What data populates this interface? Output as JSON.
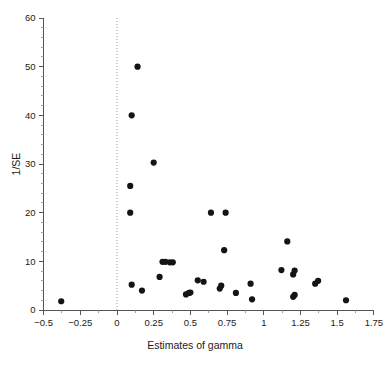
{
  "figure": {
    "background": "#ffffff",
    "point_color": "#141414",
    "axis_color": "#555555",
    "reference_line_color": "#9a9a9a"
  },
  "chart_data": {
    "type": "scatter",
    "title": "",
    "xlabel": "Estimates of gamma",
    "ylabel": "1/SE",
    "xlim": [
      -0.5,
      1.75
    ],
    "ylim": [
      0,
      60
    ],
    "xticks": [
      -0.5,
      -0.25,
      0,
      0.25,
      0.5,
      0.75,
      1,
      1.25,
      1.5,
      1.75
    ],
    "xtick_labels": [
      "−0.5",
      "−0.25",
      "0",
      "0.25",
      "0.5",
      "0.75",
      "1",
      "1.25",
      "1.5",
      "1.75"
    ],
    "yticks": [
      0,
      10,
      20,
      30,
      40,
      50,
      60
    ],
    "ytick_labels": [
      "0",
      "10",
      "20",
      "30",
      "40",
      "50",
      "60"
    ],
    "x_minor_tick_step": 0.125,
    "y_minor_tick_step": 2,
    "grid": false,
    "legend": null,
    "annotations": [
      {
        "type": "vline",
        "x": 0,
        "style": "dotted",
        "label": "null effect reference line"
      }
    ],
    "marker": {
      "shape": "circle",
      "size_px": 6.2,
      "filled": true
    },
    "points": [
      {
        "x": -0.38,
        "y": 1.8
      },
      {
        "x": 0.09,
        "y": 20.0
      },
      {
        "x": 0.09,
        "y": 25.5
      },
      {
        "x": 0.1,
        "y": 40.0
      },
      {
        "x": 0.1,
        "y": 5.2
      },
      {
        "x": 0.14,
        "y": 50.0
      },
      {
        "x": 0.17,
        "y": 4.0
      },
      {
        "x": 0.25,
        "y": 30.3
      },
      {
        "x": 0.29,
        "y": 6.8
      },
      {
        "x": 0.31,
        "y": 9.9
      },
      {
        "x": 0.33,
        "y": 9.9
      },
      {
        "x": 0.36,
        "y": 9.8
      },
      {
        "x": 0.38,
        "y": 9.8
      },
      {
        "x": 0.47,
        "y": 3.2
      },
      {
        "x": 0.49,
        "y": 3.5
      },
      {
        "x": 0.5,
        "y": 3.6
      },
      {
        "x": 0.55,
        "y": 6.1
      },
      {
        "x": 0.59,
        "y": 5.8
      },
      {
        "x": 0.64,
        "y": 20.0
      },
      {
        "x": 0.7,
        "y": 4.4
      },
      {
        "x": 0.71,
        "y": 5.0
      },
      {
        "x": 0.73,
        "y": 12.3
      },
      {
        "x": 0.74,
        "y": 20.0
      },
      {
        "x": 0.81,
        "y": 3.5
      },
      {
        "x": 0.91,
        "y": 5.4
      },
      {
        "x": 0.92,
        "y": 2.2
      },
      {
        "x": 1.12,
        "y": 8.2
      },
      {
        "x": 1.16,
        "y": 14.1
      },
      {
        "x": 1.2,
        "y": 2.7
      },
      {
        "x": 1.2,
        "y": 7.3
      },
      {
        "x": 1.21,
        "y": 3.1
      },
      {
        "x": 1.21,
        "y": 8.1
      },
      {
        "x": 1.35,
        "y": 5.4
      },
      {
        "x": 1.37,
        "y": 6.0
      },
      {
        "x": 1.56,
        "y": 2.0
      }
    ]
  }
}
